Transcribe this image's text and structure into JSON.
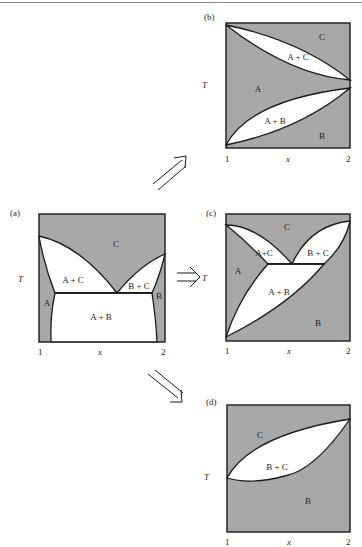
{
  "colors": {
    "shade": "#a8a8a8",
    "line": "#1a1a1a",
    "white": "#ffffff"
  },
  "axes": {
    "y_label": "T",
    "x_label": "x",
    "x_min_tick": "1",
    "x_max_tick": "2"
  },
  "panels": {
    "a": {
      "label": "(a)",
      "regions": {
        "C": "C",
        "AC": "A + C",
        "BC": "B + C",
        "A": "A",
        "B": "B",
        "AB": "A + B"
      }
    },
    "b": {
      "label": "(b)",
      "regions": {
        "C": "C",
        "AC": "A + C",
        "A": "A",
        "AB": "A + B",
        "B": "B"
      }
    },
    "c": {
      "label": "(c)",
      "regions": {
        "C": "C",
        "AC": "A+C",
        "BC": "B + C",
        "A": "A",
        "AB": "A + B",
        "B": "B"
      }
    },
    "d": {
      "label": "(d)",
      "regions": {
        "C": "C",
        "BC": "B + C",
        "B": "B"
      }
    }
  },
  "arrows": [
    {
      "from": "a",
      "to": "b",
      "direction": "up-right"
    },
    {
      "from": "a",
      "to": "c",
      "direction": "right"
    },
    {
      "from": "a",
      "to": "d",
      "direction": "down-right"
    }
  ]
}
